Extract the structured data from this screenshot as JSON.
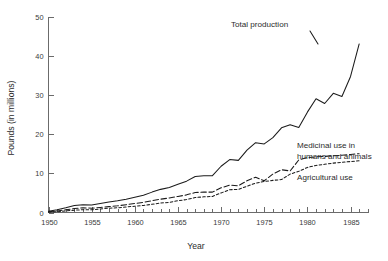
{
  "chart_data": {
    "type": "line",
    "title": "",
    "xlabel": "Year",
    "ylabel": "Pounds (in millions)",
    "xlim": [
      1950,
      1987
    ],
    "ylim": [
      0,
      50
    ],
    "grid": false,
    "legend_position": "inline-annotations",
    "x_ticks_major": [
      1950,
      1955,
      1960,
      1965,
      1970,
      1975,
      1980,
      1985
    ],
    "x_tick_labels": [
      "1950",
      "1955",
      "1960",
      "1965",
      "1970",
      "1975",
      "1980",
      "1985"
    ],
    "x_ticks_minor_step": 1,
    "y_ticks": [
      0,
      10,
      20,
      30,
      40,
      50
    ],
    "y_tick_labels": [
      "0",
      "10",
      "20",
      "30",
      "40",
      "50"
    ],
    "x": [
      1950,
      1951,
      1952,
      1953,
      1954,
      1955,
      1956,
      1957,
      1958,
      1959,
      1960,
      1961,
      1962,
      1963,
      1964,
      1965,
      1966,
      1967,
      1968,
      1969,
      1970,
      1971,
      1972,
      1973,
      1974,
      1975,
      1976,
      1977,
      1978,
      1979,
      1980,
      1981,
      1982,
      1983,
      1984,
      1985,
      1986
    ],
    "series": [
      {
        "name": "Total production",
        "label": "Total production",
        "style": "solid",
        "color": "#1b1b1b",
        "values": [
          0.3,
          0.7,
          1.2,
          1.8,
          2.0,
          1.9,
          2.3,
          2.7,
          3.0,
          3.4,
          3.9,
          4.4,
          5.2,
          5.9,
          6.4,
          7.2,
          8.0,
          9.2,
          9.4,
          9.4,
          11.8,
          13.5,
          13.3,
          15.9,
          17.8,
          17.5,
          19.1,
          21.6,
          22.4,
          21.7,
          25.6,
          29.0,
          27.8,
          30.4,
          29.6,
          34.7,
          43.0
        ]
      },
      {
        "name": "Medicinal use in humans and animals",
        "label": "Medicinal use in humans and animals",
        "style": "long-dash",
        "color": "#1b1b1b",
        "values": [
          0.2,
          0.4,
          0.7,
          1.0,
          1.2,
          1.1,
          1.3,
          1.5,
          1.7,
          2.0,
          2.3,
          2.6,
          3.0,
          3.4,
          3.7,
          4.1,
          4.5,
          5.1,
          5.2,
          5.2,
          6.3,
          7.0,
          6.8,
          8.1,
          9.0,
          8.1,
          9.8,
          10.9,
          10.6,
          13.4,
          14.0,
          14.2,
          14.3,
          14.5,
          14.6,
          14.8,
          15.0
        ]
      },
      {
        "name": "Agricultural use",
        "label": "Agricultural use",
        "style": "short-dash",
        "color": "#1b1b1b",
        "values": [
          0.1,
          0.2,
          0.4,
          0.6,
          0.7,
          0.7,
          0.9,
          1.1,
          1.2,
          1.4,
          1.6,
          1.8,
          2.1,
          2.4,
          2.6,
          3.0,
          3.3,
          3.8,
          4.0,
          4.1,
          5.0,
          5.8,
          5.9,
          6.7,
          7.5,
          7.9,
          8.2,
          8.4,
          9.8,
          10.5,
          11.5,
          12.0,
          12.3,
          12.6,
          12.8,
          13.0,
          13.2
        ]
      }
    ],
    "annotations": [
      {
        "text": "Total production",
        "for": "Total production"
      },
      {
        "text": "Medicinal use in",
        "for": "Medicinal use in humans and animals"
      },
      {
        "text": "humans and animals",
        "for": "Medicinal use in humans and animals"
      },
      {
        "text": "Agricultural use",
        "for": "Agricultural use"
      }
    ]
  }
}
